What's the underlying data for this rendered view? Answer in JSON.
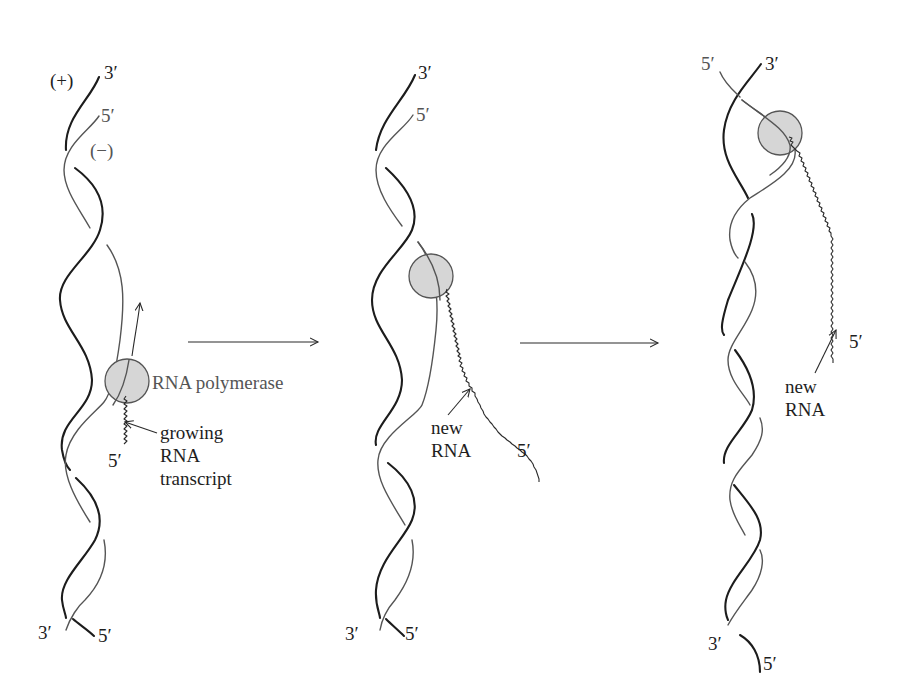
{
  "figure": {
    "colors": {
      "plus_strand": "#1c1c1c",
      "minus_strand": "#555555",
      "polymerase_fill": "#d6d6d6",
      "polymerase_stroke": "#555555",
      "background": "#ffffff"
    }
  },
  "panels": [
    {
      "id": "stage-1",
      "labels": {
        "plus_strand": "(+)",
        "minus_strand": "(−)",
        "top_plus_end": "3′",
        "top_minus_end": "5′",
        "bottom_left_end": "3′",
        "bottom_right_end": "5′",
        "rna_5prime": "5′",
        "polymerase": "RNA polymerase",
        "transcript_line1": "growing",
        "transcript_line2": "RNA",
        "transcript_line3": "transcript"
      }
    },
    {
      "id": "stage-2",
      "labels": {
        "top_plus_end": "3′",
        "top_minus_end": "5′",
        "bottom_left_end": "3′",
        "bottom_right_end": "5′",
        "rna_5prime": "5′",
        "rna_line1": "new",
        "rna_line2": "RNA"
      }
    },
    {
      "id": "stage-3",
      "labels": {
        "top_minus_end": "5′",
        "top_plus_end": "3′",
        "bottom_left_end": "3′",
        "bottom_right_end": "5′",
        "rna_5prime": "5′",
        "rna_line1": "new",
        "rna_line2": "RNA"
      }
    }
  ],
  "transitions": [
    {
      "from": "stage-1",
      "to": "stage-2",
      "symbol": "right-arrow"
    },
    {
      "from": "stage-2",
      "to": "stage-3",
      "symbol": "right-arrow"
    }
  ]
}
